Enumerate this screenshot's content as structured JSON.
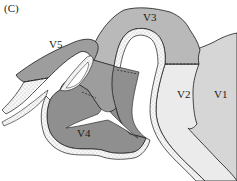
{
  "figure": {
    "panel_label": "(C)",
    "areas": [
      {
        "id": "V1",
        "label": "V1",
        "color": "#d6d6d6"
      },
      {
        "id": "V2",
        "label": "V2",
        "color": "#ebebeb"
      },
      {
        "id": "V3",
        "label": "V3",
        "color": "#b9b9b9"
      },
      {
        "id": "V4",
        "label": "V4",
        "color": "#8f8f8f"
      },
      {
        "id": "V5",
        "label": "V5",
        "color": "#9d9d9d"
      }
    ],
    "white_matter_color": "#ffffff",
    "gray_matter_band_color": "#f4f4f4",
    "outline_color": "#1a1a1a"
  }
}
